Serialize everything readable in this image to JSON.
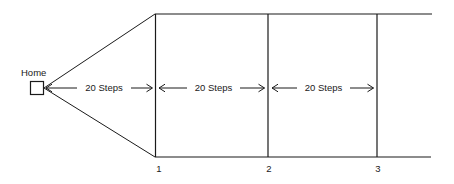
{
  "diagram": {
    "title_label": "Home",
    "home_marker": "square-marker",
    "segments": [
      {
        "id": "seg-1",
        "label": "20 Steps"
      },
      {
        "id": "seg-2",
        "label": "20 Steps"
      },
      {
        "id": "seg-3",
        "label": "20 Steps"
      }
    ],
    "station_labels": [
      "1",
      "2",
      "3"
    ],
    "colors": {
      "stroke": "#1a1a1a",
      "text": "#1a1a1a",
      "background": "#ffffff"
    }
  }
}
